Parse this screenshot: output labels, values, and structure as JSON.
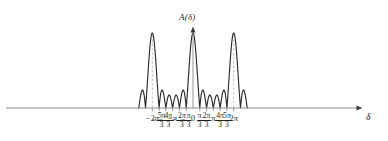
{
  "figure": {
    "ylabel": "A(δ)",
    "ylabel_fn": "A",
    "ylabel_arg": "δ",
    "xlabel": "δ",
    "origin_label": "0",
    "curve_color": "#2b2b2b",
    "axis_color": "#8b8b8b",
    "dashed_color": "#b0b0b0",
    "background": "#ffffff"
  },
  "ticks": [
    {
      "id": "t-2pi",
      "sign": "−",
      "whole": "2π",
      "num": "",
      "den": "",
      "value": -6.2832
    },
    {
      "id": "t-5pi-3",
      "sign": "−",
      "whole": "",
      "num": "5π",
      "den": "3",
      "value": -5.236
    },
    {
      "id": "t-4pi-3",
      "sign": "−",
      "whole": "",
      "num": "4π",
      "den": "3",
      "value": -4.1888
    },
    {
      "id": "t-pi",
      "sign": "−",
      "whole": "π",
      "num": "",
      "den": "",
      "value": -3.1416
    },
    {
      "id": "t-2pi-3",
      "sign": "−",
      "whole": "",
      "num": "2π",
      "den": "3",
      "value": -2.0944
    },
    {
      "id": "t-pi-3",
      "sign": "−",
      "whole": "",
      "num": "π",
      "den": "3",
      "value": -1.0472
    },
    {
      "id": "t0",
      "sign": "",
      "whole": "0",
      "num": "",
      "den": "",
      "value": 0.0
    },
    {
      "id": "tpi-3",
      "sign": "",
      "whole": "",
      "num": "π",
      "den": "3",
      "value": 1.0472
    },
    {
      "id": "t2pi-3",
      "sign": "",
      "whole": "",
      "num": "2π",
      "den": "3",
      "value": 2.0944
    },
    {
      "id": "tpi",
      "sign": "",
      "whole": "π",
      "num": "",
      "den": "",
      "value": 3.1416
    },
    {
      "id": "t4pi-3",
      "sign": "",
      "whole": "",
      "num": "4π",
      "den": "3",
      "value": 4.1888
    },
    {
      "id": "t5pi-3",
      "sign": "",
      "whole": "",
      "num": "5π",
      "den": "3",
      "value": 5.236
    },
    {
      "id": "t2pi",
      "sign": "",
      "whole": "2π",
      "num": "",
      "den": "",
      "value": 6.2832
    }
  ],
  "chart_data": {
    "type": "line",
    "title": "",
    "xlabel": "δ",
    "ylabel": "A(δ)",
    "xlim": [
      -8.4,
      8.1
    ],
    "ylim": [
      0,
      1.05
    ],
    "grid": false,
    "legend": null,
    "n_slits": 6,
    "formula": "A(δ) = |sin(3δ)/sin(δ/2)| / 6",
    "principal_maxima": {
      "x": [
        -6.2832,
        0,
        6.2832
      ],
      "y": [
        1.0,
        1.0,
        1.0
      ],
      "labels": [
        "−2π",
        "0",
        "2π"
      ],
      "dashed_marker": [
        true,
        false,
        true
      ]
    },
    "zeros_x": [
      -8.3776,
      -7.3304,
      -6.2832,
      -5.236,
      -4.1888,
      -3.1416,
      -2.0944,
      -1.0472,
      0,
      1.0472,
      2.0944,
      3.1416,
      4.1888,
      5.236,
      6.2832,
      7.3304,
      8.3776
    ],
    "zeros_note": "A is zero at δ = kπ/3 except where k is a multiple of 6 (principal maxima).",
    "secondary_maxima": {
      "count_between_principals": 4,
      "x": [
        -5.7596,
        -4.7124,
        -3.6652,
        -2.618,
        -1.5708,
        -0.5236,
        0.5236,
        1.5708,
        2.618,
        3.6652,
        4.7124,
        5.7596,
        6.8068,
        7.854
      ],
      "y": [
        0.233,
        0.133,
        0.113,
        0.133,
        0.233,
        0.233,
        0.233,
        0.133,
        0.113,
        0.133,
        0.233,
        0.233,
        0.233,
        0.133
      ]
    },
    "series": [
      {
        "name": "A(δ)",
        "color": "#2b2b2b",
        "x": [
          -8.3776,
          -8.1159,
          -7.854,
          -7.5922,
          -7.3304,
          -7.0686,
          -6.8068,
          -6.545,
          -6.2832,
          -6.0214,
          -5.7596,
          -5.4978,
          -5.236,
          -4.9742,
          -4.7124,
          -4.4506,
          -4.1888,
          -3.927,
          -3.6652,
          -3.4034,
          -3.1416,
          -2.8798,
          -2.618,
          -2.3562,
          -2.0944,
          -1.8326,
          -1.5708,
          -1.309,
          -1.0472,
          -0.7854,
          -0.5236,
          -0.2618,
          0,
          0.2618,
          0.5236,
          0.7854,
          1.0472,
          1.309,
          1.5708,
          1.8326,
          2.0944,
          2.3562,
          2.618,
          2.8798,
          3.1416,
          3.4034,
          3.6652,
          3.927,
          4.1888,
          4.4506,
          4.7124,
          4.9742,
          5.236,
          5.4978,
          5.7596,
          6.0214,
          6.2832,
          6.545,
          6.8068,
          7.0686,
          7.3304,
          7.5922,
          7.854,
          8.1159,
          8.3776
        ],
        "y": [
          0,
          0.173,
          0.2,
          0.133,
          0,
          0.272,
          0.69,
          0.933,
          1.0,
          0.933,
          0.69,
          0.272,
          0,
          0.133,
          0.2,
          0.133,
          0,
          0.098,
          0.155,
          0.098,
          0,
          0.098,
          0.155,
          0.098,
          0,
          0.133,
          0.2,
          0.133,
          0,
          0.272,
          0.69,
          0.933,
          1.0,
          0.933,
          0.69,
          0.272,
          0,
          0.133,
          0.2,
          0.133,
          0,
          0.098,
          0.155,
          0.098,
          0,
          0.098,
          0.155,
          0.098,
          0,
          0.133,
          0.2,
          0.133,
          0,
          0.272,
          0.69,
          0.933,
          1.0,
          0.933,
          0.69,
          0.272,
          0,
          0.133,
          0.2,
          0.133,
          0
        ]
      }
    ]
  }
}
